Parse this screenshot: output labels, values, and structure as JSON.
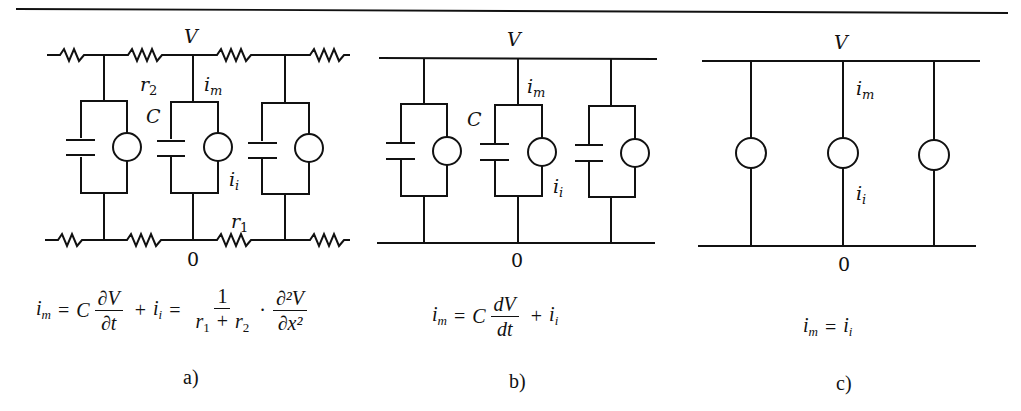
{
  "figure": {
    "panels": [
      {
        "id": "a",
        "caption": "a)",
        "labels": {
          "voltage": "V",
          "ground": "0",
          "r2": "r",
          "r2_sub": "2",
          "r1": "r",
          "r1_sub": "1",
          "im": "i",
          "im_sub": "m",
          "ii": "i",
          "ii_sub": "i",
          "capacitance": "C"
        },
        "equation": {
          "lhs": "i",
          "lhs_sub": "m",
          "eq1": "=",
          "C": "C",
          "frac1_num": "∂V",
          "frac1_den": "∂t",
          "plus": "+",
          "ii": "i",
          "ii_sub": "i",
          "eq2": "=",
          "frac2_num": "1",
          "frac2_den_r1": "r",
          "frac2_den_r1_sub": "1",
          "frac2_den_plus": "+",
          "frac2_den_r2": "r",
          "frac2_den_r2_sub": "2",
          "dot": "·",
          "frac3_num": "∂²V",
          "frac3_den": "∂x²"
        }
      },
      {
        "id": "b",
        "caption": "b)",
        "labels": {
          "voltage": "V",
          "ground": "0",
          "im": "i",
          "im_sub": "m",
          "ii": "i",
          "ii_sub": "i",
          "capacitance": "C"
        },
        "equation": {
          "lhs": "i",
          "lhs_sub": "m",
          "eq1": "=",
          "C": "C",
          "frac1_num": "dV",
          "frac1_den": "dt",
          "plus": "+",
          "ii": "i",
          "ii_sub": "i"
        }
      },
      {
        "id": "c",
        "caption": "c)",
        "labels": {
          "voltage": "V",
          "ground": "0",
          "im": "i",
          "im_sub": "m",
          "ii": "i",
          "ii_sub": "i"
        },
        "equation": {
          "lhs": "i",
          "lhs_sub": "m",
          "eq1": "=",
          "rhs": "i",
          "rhs_sub": "i"
        }
      }
    ]
  }
}
